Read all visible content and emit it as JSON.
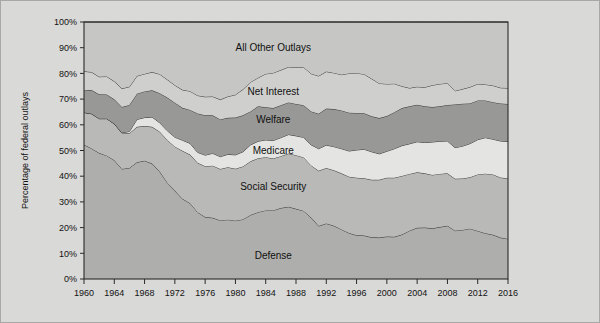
{
  "chart_data": {
    "type": "area",
    "title": "",
    "xlabel": "",
    "ylabel": "Percentage of federal outlays",
    "ylim": [
      0,
      100
    ],
    "xlim": [
      1960,
      2016
    ],
    "grid": false,
    "legend_position": "inline-labels",
    "stacked": true,
    "stack_order_bottom_to_top": [
      "Defense",
      "Social Security",
      "Medicare",
      "Welfare",
      "Net Interest",
      "All Other Outlays"
    ],
    "ytick_labels": [
      "0%",
      "10%",
      "20%",
      "30%",
      "40%",
      "50%",
      "60%",
      "70%",
      "80%",
      "90%",
      "100%"
    ],
    "ytick_values": [
      0,
      10,
      20,
      30,
      40,
      50,
      60,
      70,
      80,
      90,
      100
    ],
    "xtick_labels": [
      "1960",
      "1964",
      "1968",
      "1972",
      "1976",
      "1980",
      "1984",
      "1988",
      "1992",
      "1996",
      "2000",
      "2004",
      "2008",
      "2012",
      "2016"
    ],
    "xtick_values": [
      1960,
      1964,
      1968,
      1972,
      1976,
      1980,
      1984,
      1988,
      1992,
      1996,
      2000,
      2004,
      2008,
      2012,
      2016
    ],
    "x": [
      1960,
      1961,
      1962,
      1963,
      1964,
      1965,
      1966,
      1967,
      1968,
      1969,
      1970,
      1971,
      1972,
      1973,
      1974,
      1975,
      1976,
      1977,
      1978,
      1979,
      1980,
      1981,
      1982,
      1983,
      1984,
      1985,
      1986,
      1987,
      1988,
      1989,
      1990,
      1991,
      1992,
      1993,
      1994,
      1995,
      1996,
      1997,
      1998,
      1999,
      2000,
      2001,
      2002,
      2003,
      2004,
      2005,
      2006,
      2007,
      2008,
      2009,
      2010,
      2011,
      2012,
      2013,
      2014,
      2015,
      2016
    ],
    "series": [
      {
        "name": "Defense",
        "color": "#aeaeac",
        "label_x": 1985,
        "label_y": 9,
        "values": [
          52.2,
          50.8,
          49.0,
          48.0,
          46.2,
          42.8,
          43.2,
          45.4,
          46.0,
          44.9,
          41.8,
          37.5,
          34.3,
          31.2,
          29.5,
          26.0,
          24.1,
          23.8,
          22.8,
          23.1,
          22.7,
          23.2,
          24.9,
          26.0,
          26.7,
          26.7,
          27.6,
          28.1,
          27.3,
          26.5,
          23.9,
          20.6,
          21.6,
          20.7,
          19.3,
          17.9,
          17.0,
          16.9,
          16.2,
          16.1,
          16.5,
          16.4,
          17.3,
          18.8,
          19.9,
          20.0,
          19.7,
          20.2,
          20.7,
          18.8,
          19.1,
          19.6,
          18.7,
          17.8,
          17.2,
          16.1,
          15.6
        ]
      },
      {
        "name": "Social Security",
        "color": "#b9b9b7",
        "label_x": 1985,
        "label_y": 36,
        "values": [
          12.6,
          13.5,
          13.4,
          14.4,
          14.2,
          14.1,
          13.5,
          13.8,
          13.5,
          14.3,
          15.5,
          16.6,
          17.2,
          18.7,
          18.9,
          19.2,
          19.8,
          20.3,
          20.0,
          20.4,
          20.2,
          20.6,
          20.9,
          21.0,
          20.7,
          20.2,
          20.2,
          20.7,
          20.9,
          20.8,
          20.3,
          21.5,
          21.6,
          21.6,
          21.8,
          21.9,
          22.4,
          22.3,
          22.4,
          22.5,
          22.9,
          23.0,
          22.8,
          22.1,
          21.6,
          21.1,
          20.8,
          20.7,
          20.4,
          20.2,
          20.0,
          20.0,
          22.0,
          23.2,
          23.5,
          23.4,
          23.5
        ]
      },
      {
        "name": "Medicare",
        "color": "#e4e4e2",
        "label_x": 1985,
        "label_y": 50,
        "values": [
          0.0,
          0.0,
          0.0,
          0.0,
          0.0,
          0.0,
          0.7,
          2.9,
          3.3,
          3.8,
          3.5,
          3.6,
          3.7,
          4.1,
          4.4,
          4.1,
          4.3,
          4.8,
          4.8,
          5.0,
          5.4,
          5.7,
          6.4,
          6.6,
          6.7,
          7.0,
          7.2,
          7.4,
          7.5,
          7.8,
          8.0,
          8.6,
          8.9,
          9.2,
          9.6,
          10.0,
          10.8,
          11.3,
          10.9,
          10.1,
          10.3,
          11.3,
          11.8,
          11.7,
          11.9,
          12.0,
          12.8,
          12.7,
          12.6,
          12.1,
          12.6,
          13.1,
          13.5,
          14.0,
          13.7,
          14.2,
          14.4
        ]
      },
      {
        "name": "Welfare",
        "color": "#989896",
        "label_x": 1985,
        "label_y": 62,
        "values": [
          8.5,
          9.2,
          9.5,
          9.4,
          9.5,
          10.0,
          10.3,
          10.0,
          10.2,
          10.4,
          11.5,
          12.9,
          13.4,
          12.6,
          13.0,
          15.1,
          15.5,
          14.8,
          14.5,
          14.2,
          14.5,
          14.2,
          13.0,
          13.6,
          12.7,
          12.6,
          12.6,
          12.5,
          12.4,
          12.5,
          13.0,
          13.6,
          14.2,
          14.6,
          14.9,
          14.9,
          14.4,
          14.0,
          13.8,
          13.9,
          13.7,
          14.2,
          14.6,
          14.6,
          14.4,
          14.1,
          13.6,
          13.6,
          14.0,
          16.8,
          16.5,
          15.6,
          15.3,
          14.5,
          14.4,
          14.6,
          14.6
        ]
      },
      {
        "name": "Net Interest",
        "color": "#cfcfcd",
        "label_x": 1985,
        "label_y": 73,
        "values": [
          7.5,
          7.0,
          6.8,
          7.0,
          7.0,
          7.2,
          7.1,
          6.9,
          6.8,
          7.1,
          7.4,
          7.0,
          6.8,
          7.0,
          7.3,
          7.0,
          7.2,
          7.3,
          7.7,
          8.3,
          8.9,
          10.1,
          11.4,
          11.1,
          13.0,
          13.7,
          13.7,
          13.8,
          14.3,
          14.8,
          14.7,
          14.7,
          14.4,
          14.1,
          13.9,
          15.3,
          15.5,
          15.2,
          14.6,
          13.5,
          12.5,
          11.1,
          8.5,
          7.1,
          7.0,
          7.4,
          8.5,
          8.7,
          8.5,
          5.3,
          5.7,
          6.4,
          6.4,
          6.2,
          6.5,
          6.1,
          6.2
        ]
      },
      {
        "name": "All Other Outlays",
        "color": "#c6c6c4",
        "label_x": 1985,
        "label_y": 90,
        "values": [
          19.2,
          19.5,
          21.3,
          21.2,
          23.1,
          25.9,
          25.2,
          21.0,
          20.2,
          19.5,
          20.3,
          22.4,
          24.6,
          26.4,
          26.9,
          28.6,
          29.1,
          29.0,
          30.2,
          29.0,
          28.3,
          26.2,
          23.4,
          21.7,
          20.2,
          19.8,
          18.7,
          17.5,
          17.6,
          17.6,
          20.1,
          21.0,
          19.3,
          19.8,
          20.5,
          20.0,
          19.9,
          20.3,
          22.1,
          23.9,
          24.1,
          24.0,
          25.0,
          25.7,
          25.2,
          25.4,
          24.6,
          24.1,
          23.8,
          26.8,
          26.1,
          25.3,
          24.1,
          24.3,
          24.7,
          25.6,
          25.7
        ]
      }
    ]
  },
  "axis": {
    "y_title": "Percentage of federal outlays"
  }
}
